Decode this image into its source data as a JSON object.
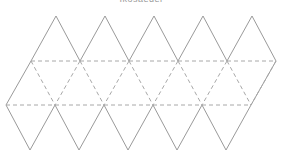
{
  "title": "Ikosaeder",
  "diagram": {
    "type": "icosahedron-net",
    "line_color": "#9a9a9a",
    "triangle_width": 49,
    "rows": {
      "top_y": 16,
      "upper_fold_y": 61,
      "lower_fold_y": 105,
      "bottom_y": 150
    },
    "top_apexes_x": [
      56,
      105,
      154,
      203,
      252
    ],
    "upper_fold_x": [
      31,
      80,
      129,
      178,
      227,
      276
    ],
    "lower_fold_x": [
      6,
      55,
      104,
      153,
      202,
      251
    ],
    "bottom_apexes_x": [
      30,
      79,
      128,
      177,
      226
    ],
    "face_count": 20
  }
}
